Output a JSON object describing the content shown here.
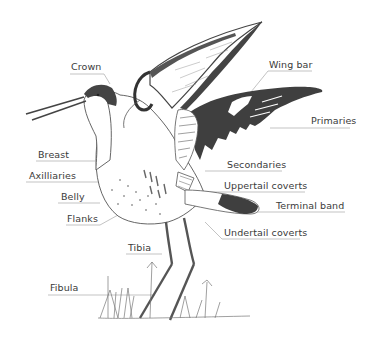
{
  "diagram": {
    "colors": {
      "ink": "#4a4a4a",
      "dark_plumage": "#3f3f3f",
      "leader_line": "#8a8a8a",
      "label_text": "#3a3a3a",
      "background": "#ffffff"
    },
    "labels": [
      {
        "id": "crown",
        "text": "Crown",
        "x": 71,
        "y": 62
      },
      {
        "id": "wing-bar",
        "text": "Wing bar",
        "x": 269,
        "y": 60
      },
      {
        "id": "primaries",
        "text": "Primaries",
        "x": 311,
        "y": 116
      },
      {
        "id": "breast",
        "text": "Breast",
        "x": 38,
        "y": 150
      },
      {
        "id": "axilliaries",
        "text": "Axilliaries",
        "x": 29,
        "y": 171
      },
      {
        "id": "belly",
        "text": "Belly",
        "x": 61,
        "y": 192
      },
      {
        "id": "flanks",
        "text": "Flanks",
        "x": 67,
        "y": 214
      },
      {
        "id": "secondaries",
        "text": "Secondaries",
        "x": 227,
        "y": 160
      },
      {
        "id": "uppertail-coverts",
        "text": "Uppertail coverts",
        "x": 224,
        "y": 181
      },
      {
        "id": "terminal-band",
        "text": "Terminal band",
        "x": 276,
        "y": 201
      },
      {
        "id": "undertail-coverts",
        "text": "Undertail coverts",
        "x": 224,
        "y": 228
      },
      {
        "id": "tibia",
        "text": "Tibia",
        "x": 128,
        "y": 243
      },
      {
        "id": "fibula",
        "text": "Fibula",
        "x": 50,
        "y": 283
      }
    ]
  }
}
